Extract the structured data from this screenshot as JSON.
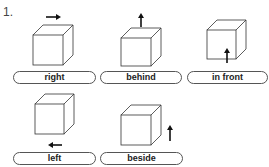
{
  "exercise": {
    "number": "1."
  },
  "items": [
    {
      "label": "right",
      "arrow": "right-arrow-icon"
    },
    {
      "label": "behind",
      "arrow": "up-arrow-icon"
    },
    {
      "label": "in front",
      "arrow": "up-arrow-icon"
    },
    {
      "label": "left",
      "arrow": "left-arrow-icon"
    },
    {
      "label": "beside",
      "arrow": "up-arrow-icon"
    }
  ]
}
